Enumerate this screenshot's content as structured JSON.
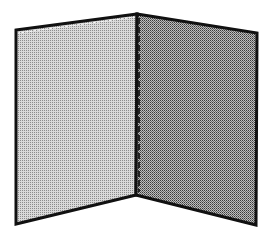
{
  "illustration": {
    "subject": "open folder / two-panel divider",
    "background": "#ffffff",
    "outline_color": "#111111",
    "left_panel": {
      "points": "16,30 137,14 136,195 16,224",
      "base_color": "#d9d9d9",
      "dot_color": "#8c8c8c"
    },
    "right_panel": {
      "points": "137,14 257,33 256,225 136,195",
      "base_color": "#bdbdbd",
      "dot_color": "#3a3a3a"
    }
  }
}
